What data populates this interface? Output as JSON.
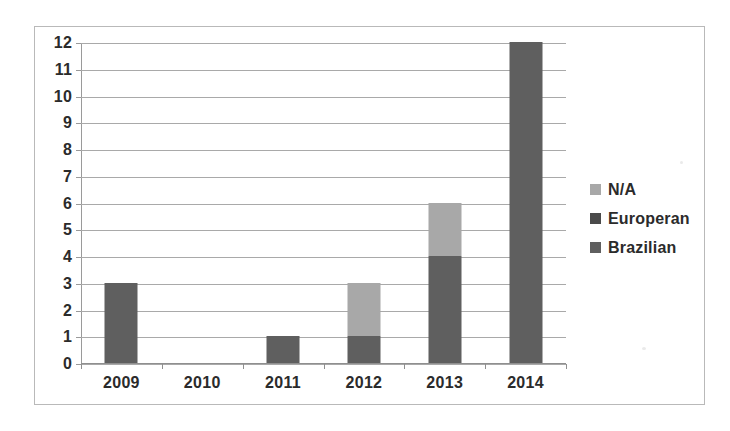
{
  "chart_data": {
    "type": "bar",
    "title": "",
    "subtitle": "",
    "xlabel": "",
    "ylabel": "",
    "stacked": true,
    "grid": true,
    "legend_position": "right",
    "categories": [
      "2009",
      "2010",
      "2011",
      "2012",
      "2013",
      "2014"
    ],
    "ylim": [
      0,
      12
    ],
    "yticks": [
      0,
      1,
      2,
      3,
      4,
      5,
      6,
      7,
      8,
      9,
      10,
      11,
      12
    ],
    "ytick_labels": [
      "0",
      "1",
      "2",
      "3",
      "4",
      "5",
      "6",
      "7",
      "8",
      "9",
      "10",
      "11",
      "12"
    ],
    "series": [
      {
        "name": "Brazilian",
        "color": "#5f5f5f",
        "values": [
          3,
          0,
          1,
          1,
          4,
          12
        ]
      },
      {
        "name": "Europeran",
        "color": "#4a4a4a",
        "values": [
          0,
          0,
          0,
          0,
          0,
          0
        ]
      },
      {
        "name": "N/A",
        "color": "#a8a8a8",
        "values": [
          0,
          0,
          0,
          2,
          2,
          0
        ]
      }
    ],
    "totals": [
      3,
      0,
      1,
      3,
      6,
      12
    ]
  },
  "legend": {
    "items": [
      {
        "label": "N/A",
        "color": "#a8a8a8",
        "swatch_name": "legend-swatch-na"
      },
      {
        "label": "Europeran",
        "color": "#4a4a4a",
        "swatch_name": "legend-swatch-europeran"
      },
      {
        "label": "Brazilian",
        "color": "#5f5f5f",
        "swatch_name": "legend-swatch-brazilian"
      }
    ]
  },
  "colors": {
    "na": "#a8a8a8",
    "europeran": "#4a4a4a",
    "brazilian": "#5f5f5f",
    "gridline": "#a9a9a9",
    "axis": "#8f8f8f",
    "frame": "#b9b9b9",
    "text": "#2b2b2b",
    "background": "#ffffff"
  }
}
